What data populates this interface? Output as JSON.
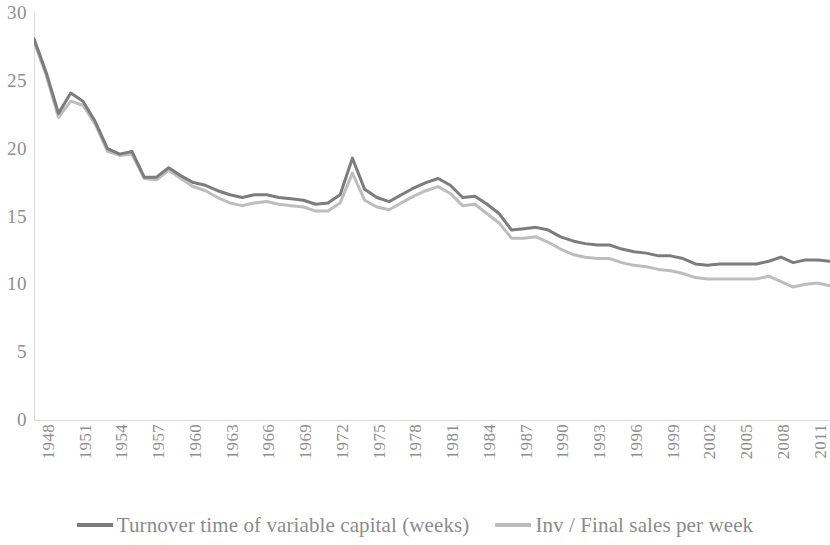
{
  "chart_data": {
    "type": "line",
    "title": "",
    "xlabel": "",
    "ylabel": "",
    "xlim": [
      1948,
      2013
    ],
    "ylim": [
      0,
      30
    ],
    "ytick_values": [
      30,
      25,
      20,
      15,
      10,
      5,
      0
    ],
    "ytick_labels": [
      "30",
      "25",
      "20",
      "15",
      "10",
      "5",
      "0"
    ],
    "grid": false,
    "legend_position": "bottom",
    "x": [
      1948,
      1949,
      1950,
      1951,
      1952,
      1953,
      1954,
      1955,
      1956,
      1957,
      1958,
      1959,
      1960,
      1961,
      1962,
      1963,
      1964,
      1965,
      1966,
      1967,
      1968,
      1969,
      1970,
      1971,
      1972,
      1973,
      1974,
      1975,
      1976,
      1977,
      1978,
      1979,
      1980,
      1981,
      1982,
      1983,
      1984,
      1985,
      1986,
      1987,
      1988,
      1989,
      1990,
      1991,
      1992,
      1993,
      1994,
      1995,
      1996,
      1997,
      1998,
      1999,
      2000,
      2001,
      2002,
      2003,
      2004,
      2005,
      2006,
      2007,
      2008,
      2009,
      2010,
      2011,
      2012,
      2013
    ],
    "xtick_labels": [
      "1948",
      "1951",
      "1954",
      "1957",
      "1960",
      "1963",
      "1966",
      "1969",
      "1972",
      "1975",
      "1978",
      "1981",
      "1984",
      "1987",
      "1990",
      "1993",
      "1996",
      "1999",
      "2002",
      "2005",
      "2008",
      "2011"
    ],
    "series": [
      {
        "name": "Turnover time of variable capital (weeks)",
        "color": "#7c7c7c",
        "values": [
          28.1,
          25.6,
          22.6,
          24.1,
          23.5,
          22.0,
          20.0,
          19.6,
          19.8,
          17.9,
          17.9,
          18.6,
          18.0,
          17.5,
          17.3,
          16.9,
          16.6,
          16.4,
          16.6,
          16.6,
          16.4,
          16.3,
          16.2,
          15.9,
          16.0,
          16.6,
          19.3,
          17.0,
          16.4,
          16.1,
          16.6,
          17.1,
          17.5,
          17.8,
          17.3,
          16.4,
          16.5,
          15.9,
          15.2,
          14.0,
          14.1,
          14.2,
          14.0,
          13.5,
          13.2,
          13.0,
          12.9,
          12.9,
          12.6,
          12.4,
          12.3,
          12.1,
          12.1,
          11.9,
          11.5,
          11.4,
          11.5,
          11.5,
          11.5,
          11.5,
          11.7,
          12.0,
          11.6,
          11.8,
          11.8,
          11.7
        ]
      },
      {
        "name": "Inv / Final sales per week",
        "color": "#bdbdbd",
        "values": [
          27.9,
          25.4,
          22.3,
          23.5,
          23.2,
          21.8,
          19.8,
          19.5,
          19.6,
          17.8,
          17.7,
          18.4,
          17.8,
          17.2,
          16.9,
          16.4,
          16.0,
          15.8,
          16.0,
          16.1,
          15.9,
          15.8,
          15.7,
          15.4,
          15.4,
          16.0,
          18.2,
          16.2,
          15.7,
          15.5,
          16.0,
          16.5,
          16.9,
          17.2,
          16.7,
          15.8,
          15.9,
          15.2,
          14.5,
          13.4,
          13.4,
          13.5,
          13.1,
          12.6,
          12.2,
          12.0,
          11.9,
          11.9,
          11.6,
          11.4,
          11.3,
          11.1,
          11.0,
          10.8,
          10.5,
          10.4,
          10.4,
          10.4,
          10.4,
          10.4,
          10.6,
          10.2,
          9.8,
          10.0,
          10.1,
          9.9
        ]
      }
    ]
  },
  "legend": {
    "items": [
      {
        "label": "Turnover time of variable capital (weeks)",
        "color": "#7c7c7c"
      },
      {
        "label": "Inv / Final sales per week",
        "color": "#bdbdbd"
      }
    ]
  },
  "axes": {
    "y_axis_name": "y-axis",
    "x_axis_name": "x-axis"
  }
}
